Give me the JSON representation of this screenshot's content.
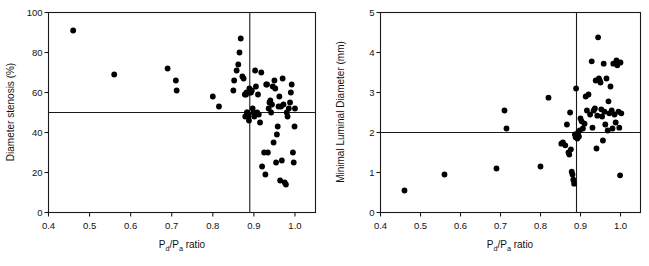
{
  "figure": {
    "background": "#ffffff",
    "marker_color": "#000000",
    "axis_color": "#1a1a1a"
  },
  "chart_data": [
    {
      "type": "scatter",
      "title": "",
      "panel": "left",
      "xlabel": "Pd/Pa ratio",
      "xlabel_parts": {
        "p1": "P",
        "sub1": "d",
        "slash": "/",
        "p2": "P",
        "sub2": "a",
        "tail": " ratio"
      },
      "ylabel": "Diameter stenosis (%)",
      "xlim": [
        0.4,
        1.05
      ],
      "ylim": [
        0,
        100
      ],
      "xticks": [
        0.4,
        0.5,
        0.6,
        0.7,
        0.8,
        0.9,
        1.0
      ],
      "xticklabels": [
        "0.4",
        "0.5",
        "0.6",
        "0.7",
        "0.8",
        "0.9",
        "1.0"
      ],
      "yticks": [
        0,
        20,
        40,
        60,
        80,
        100
      ],
      "yticklabels": [
        "0",
        "20",
        "40",
        "60",
        "80",
        "100"
      ],
      "grid": false,
      "legend": "none",
      "reference_lines": {
        "horizontal": 50,
        "vertical": 0.89
      },
      "x": [
        0.46,
        0.56,
        0.69,
        0.71,
        0.712,
        0.8,
        0.815,
        0.85,
        0.852,
        0.858,
        0.862,
        0.865,
        0.868,
        0.872,
        0.875,
        0.878,
        0.879,
        0.881,
        0.882,
        0.883,
        0.884,
        0.885,
        0.886,
        0.887,
        0.888,
        0.889,
        0.89,
        0.891,
        0.893,
        0.895,
        0.897,
        0.899,
        0.901,
        0.903,
        0.905,
        0.908,
        0.91,
        0.912,
        0.915,
        0.918,
        0.92,
        0.925,
        0.928,
        0.93,
        0.932,
        0.934,
        0.936,
        0.938,
        0.94,
        0.942,
        0.944,
        0.946,
        0.948,
        0.95,
        0.952,
        0.954,
        0.956,
        0.958,
        0.96,
        0.962,
        0.964,
        0.966,
        0.968,
        0.97,
        0.972,
        0.975,
        0.978,
        0.98,
        0.982,
        0.985,
        0.988,
        0.99,
        0.992,
        0.995,
        0.997,
        0.999,
        1.0
      ],
      "y": [
        91,
        69,
        72,
        66,
        61,
        58,
        53,
        61,
        66,
        71,
        74,
        80,
        87,
        68,
        67,
        59,
        48,
        59,
        60,
        50,
        50,
        49,
        49,
        48,
        46,
        62,
        60,
        61,
        60,
        61,
        52,
        50,
        48,
        71,
        63,
        50,
        59,
        49,
        45,
        70,
        23,
        30,
        19,
        64,
        64,
        30,
        52,
        55,
        56,
        50,
        54,
        63,
        35,
        66,
        62,
        25,
        39,
        43,
        53,
        58,
        16,
        53,
        26,
        67,
        54,
        15,
        14,
        50,
        48,
        52,
        55,
        60,
        64,
        30,
        25,
        43,
        52
      ]
    },
    {
      "type": "scatter",
      "title": "",
      "panel": "right",
      "xlabel": "Pd/Pa ratio",
      "xlabel_parts": {
        "p1": "P",
        "sub1": "d",
        "slash": "/",
        "p2": "P",
        "sub2": "a",
        "tail": " ratio"
      },
      "ylabel": "Minimal Luminal Diameter (mm)",
      "xlim": [
        0.4,
        1.05
      ],
      "ylim": [
        0,
        5
      ],
      "xticks": [
        0.4,
        0.5,
        0.6,
        0.7,
        0.8,
        0.9,
        1.0
      ],
      "xticklabels": [
        "0.4",
        "0.5",
        "0.6",
        "0.7",
        "0.8",
        "0.9",
        "1.0"
      ],
      "yticks": [
        0,
        1,
        2,
        3,
        4,
        5
      ],
      "yticklabels": [
        "0",
        "1",
        "2",
        "3",
        "4",
        "5"
      ],
      "grid": false,
      "legend": "none",
      "reference_lines": {
        "horizontal": 2.0,
        "vertical": 0.89
      },
      "x": [
        0.46,
        0.56,
        0.69,
        0.71,
        0.715,
        0.8,
        0.82,
        0.852,
        0.856,
        0.862,
        0.866,
        0.87,
        0.872,
        0.874,
        0.876,
        0.878,
        0.88,
        0.882,
        0.884,
        0.886,
        0.888,
        0.889,
        0.89,
        0.892,
        0.894,
        0.896,
        0.898,
        0.9,
        0.903,
        0.906,
        0.91,
        0.913,
        0.916,
        0.92,
        0.924,
        0.928,
        0.93,
        0.933,
        0.936,
        0.938,
        0.94,
        0.942,
        0.944,
        0.946,
        0.948,
        0.95,
        0.952,
        0.954,
        0.956,
        0.958,
        0.96,
        0.962,
        0.965,
        0.968,
        0.97,
        0.972,
        0.975,
        0.978,
        0.98,
        0.982,
        0.985,
        0.988,
        0.99,
        0.992,
        0.995,
        0.997,
        0.999,
        1.0,
        1.002
      ],
      "y": [
        0.55,
        0.95,
        1.1,
        2.55,
        2.1,
        1.15,
        2.87,
        1.72,
        1.75,
        1.68,
        2.2,
        1.5,
        1.45,
        2.5,
        1.58,
        1.02,
        0.95,
        0.82,
        0.72,
        1.95,
        1.88,
        3.1,
        1.88,
        1.85,
        2.0,
        1.9,
        2.05,
        2.35,
        2.28,
        2.1,
        2.22,
        2.9,
        2.55,
        2.95,
        2.45,
        3.78,
        2.12,
        2.55,
        2.6,
        3.3,
        1.6,
        2.42,
        4.38,
        3.35,
        3.3,
        3.25,
        2.58,
        2.4,
        1.8,
        3.72,
        2.52,
        2.2,
        3.35,
        2.05,
        2.78,
        2.48,
        3.15,
        2.55,
        2.1,
        3.72,
        2.45,
        2.25,
        3.8,
        3.68,
        2.52,
        2.12,
        0.93,
        3.75,
        2.48
      ]
    }
  ]
}
